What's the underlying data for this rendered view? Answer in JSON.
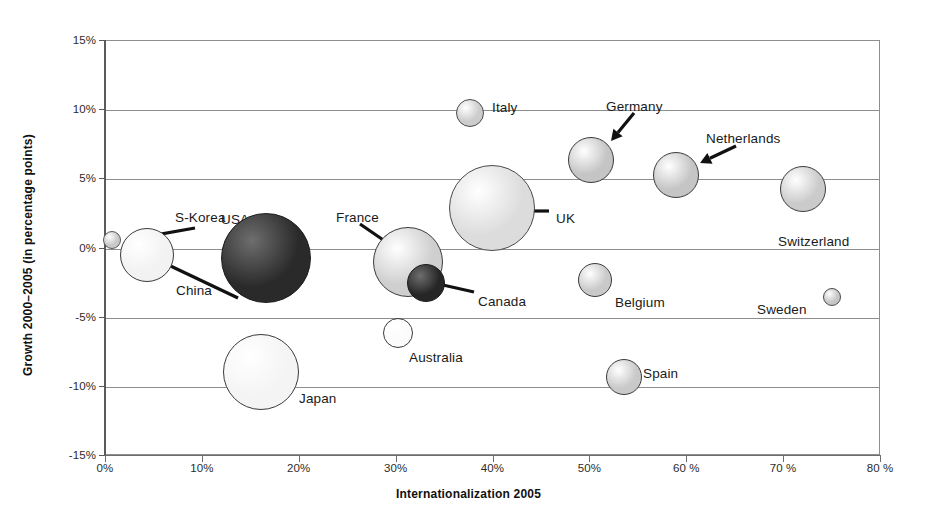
{
  "chart_data": {
    "type": "scatter",
    "subtype": "bubble",
    "title": "",
    "xlabel": "Internationalization 2005",
    "ylabel": "Growth 2000–2005  (in percentage points)",
    "xlim": [
      0,
      80
    ],
    "ylim": [
      -15,
      15
    ],
    "grid": true,
    "legend": "none",
    "xtick_labels": [
      "0%",
      "10%",
      "20%",
      "30%",
      "40%",
      "50%",
      "60 %",
      "70 %",
      "80 %"
    ],
    "xtick_values": [
      0,
      10,
      20,
      30,
      40,
      50,
      60,
      70,
      80
    ],
    "ytick_labels": [
      "15%",
      "10%",
      "5%",
      "0%",
      "-5%",
      "-10%",
      "-15%"
    ],
    "ytick_values": [
      15,
      10,
      5,
      0,
      -5,
      -10,
      -15
    ],
    "points": [
      {
        "name": "S-Korea",
        "x": 0.6,
        "y": 0.6,
        "r": 9,
        "fill": "#c8c8c8",
        "stroke": "#555555",
        "label_mode": "arrow",
        "label_x": 175,
        "label_y": 210,
        "arrow": {
          "x1": 195,
          "y1": 228,
          "x2": 127,
          "y2": 240
        }
      },
      {
        "name": "China",
        "x": 4.2,
        "y": -0.5,
        "r": 27,
        "fill": "#f2f2f2",
        "stroke": "#3a3a3a",
        "label_mode": "arrow",
        "label_x": 176,
        "label_y": 283,
        "arrow": {
          "x1": 238,
          "y1": 298,
          "x2": 158,
          "y2": 260
        }
      },
      {
        "name": "USA",
        "x": 16.5,
        "y": -0.7,
        "r": 45,
        "fill": "#2a2a2a",
        "stroke": "#1a1a1a",
        "label_mode": "arrow",
        "label_x": 221,
        "label_y": 212,
        "arrow": {
          "x1": 243,
          "y1": 228,
          "x2": 268,
          "y2": 252
        }
      },
      {
        "name": "Japan",
        "x": 16.0,
        "y": -8.9,
        "r": 38,
        "fill": "#f4f4f4",
        "stroke": "#3a3a3a",
        "label_mode": "right",
        "label_x": 299,
        "label_y": 391
      },
      {
        "name": "Australia",
        "x": 30.1,
        "y": -6.1,
        "r": 15,
        "fill": "#fbfbfb",
        "stroke": "#3a3a3a",
        "label_mode": "right",
        "label_x": 409,
        "label_y": 350
      },
      {
        "name": "France",
        "x": 31.2,
        "y": -1.0,
        "r": 35,
        "fill": "#cfcfcf",
        "stroke": "#3a3a3a",
        "label_mode": "arrow",
        "label_x": 336,
        "label_y": 210,
        "arrow": {
          "x1": 360,
          "y1": 224,
          "x2": 392,
          "y2": 246
        }
      },
      {
        "name": "Canada",
        "x": 33.0,
        "y": -2.5,
        "r": 19,
        "fill": "#262626",
        "stroke": "#1a1a1a",
        "label_mode": "arrow",
        "label_x": 478,
        "label_y": 294,
        "arrow": {
          "x1": 474,
          "y1": 292,
          "x2": 430,
          "y2": 282
        }
      },
      {
        "name": "Italy",
        "x": 37.6,
        "y": 9.8,
        "r": 14,
        "fill": "#cccccc",
        "stroke": "#4a4a4a",
        "label_mode": "right",
        "label_x": 492,
        "label_y": 100
      },
      {
        "name": "UK",
        "x": 39.8,
        "y": 2.9,
        "r": 43,
        "fill": "#dcdcdc",
        "stroke": "#4a4a4a",
        "label_mode": "arrow",
        "label_x": 556,
        "label_y": 211,
        "arrow": {
          "x1": 549,
          "y1": 211,
          "x2": 517,
          "y2": 211
        }
      },
      {
        "name": "Germany",
        "x": 50.1,
        "y": 6.4,
        "r": 23,
        "fill": "#c5c5c5",
        "stroke": "#3a3a3a",
        "label_mode": "arrow",
        "label_x": 606,
        "label_y": 99,
        "arrow": {
          "x1": 634,
          "y1": 113,
          "x2": 611,
          "y2": 141
        }
      },
      {
        "name": "Belgium",
        "x": 50.5,
        "y": -2.3,
        "r": 17,
        "fill": "#c9c9c9",
        "stroke": "#3a3a3a",
        "label_mode": "right",
        "label_x": 615,
        "label_y": 295
      },
      {
        "name": "Spain",
        "x": 53.5,
        "y": -9.3,
        "r": 18,
        "fill": "#c9c9c9",
        "stroke": "#3a3a3a",
        "label_mode": "right",
        "label_x": 643,
        "label_y": 366
      },
      {
        "name": "Netherlands",
        "x": 58.8,
        "y": 5.3,
        "r": 23,
        "fill": "#c5c5c5",
        "stroke": "#3a3a3a",
        "label_mode": "arrow",
        "label_x": 706,
        "label_y": 131,
        "arrow": {
          "x1": 736,
          "y1": 146,
          "x2": 700,
          "y2": 163
        }
      },
      {
        "name": "Switzerland",
        "x": 71.9,
        "y": 4.3,
        "r": 23,
        "fill": "#cbcbcb",
        "stroke": "#3a3a3a",
        "label_mode": "below",
        "label_x": 778,
        "label_y": 234
      },
      {
        "name": "Sweden",
        "x": 74.9,
        "y": -3.5,
        "r": 9,
        "fill": "#c6c6c6",
        "stroke": "#4a4a4a",
        "label_mode": "left",
        "label_x": 757,
        "label_y": 302
      }
    ]
  },
  "axes": {
    "xlabel": "Internationalization 2005",
    "ylabel": "Growth 2000–2005  (in percentage points)"
  }
}
